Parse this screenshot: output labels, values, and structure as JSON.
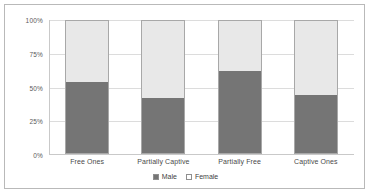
{
  "chart_data": {
    "type": "bar",
    "subtype": "stacked-100-percent",
    "title": "",
    "xlabel": "",
    "ylabel": "",
    "categories": [
      "Free Ones",
      "Partially Captive",
      "Partially Free",
      "Captive Ones"
    ],
    "series": [
      {
        "name": "Male",
        "values": [
          54,
          42,
          62,
          44
        ],
        "color": "#757575"
      },
      {
        "name": "Female",
        "values": [
          46,
          58,
          38,
          56
        ],
        "color": "#e8e8e8"
      }
    ],
    "ylim": [
      0,
      100
    ],
    "y_ticks": [
      0,
      25,
      50,
      75,
      100
    ],
    "y_tick_labels": [
      "0%",
      "25%",
      "50%",
      "75%",
      "100%"
    ],
    "grid": true,
    "legend_position": "bottom",
    "units": "percent"
  },
  "axis": {
    "y_labels": [
      "100%",
      "75%",
      "50%",
      "25%",
      "0%"
    ]
  },
  "legend": {
    "entries": [
      {
        "label": "Male",
        "swatch": "filled-dark-square"
      },
      {
        "label": "Female",
        "swatch": "outlined-light-square"
      }
    ]
  }
}
